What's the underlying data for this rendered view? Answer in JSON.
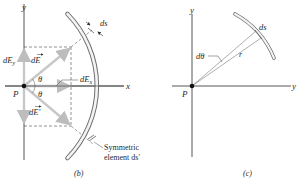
{
  "panel_b": {
    "caption": "(b)",
    "axis_y_label": "y",
    "axis_x_label": "x",
    "point_label": "P",
    "dE_label": "dE",
    "dE_prime_label": "dE'",
    "dEy_label": "dE",
    "dEy_sub": "y",
    "dEx_label": "dE",
    "dEx_sub": "x",
    "theta_upper": "θ",
    "theta_lower": "θ",
    "ds_label": "ds",
    "symmetric_line1": "Symmetric",
    "symmetric_line2": "element ds'"
  },
  "panel_c": {
    "caption": "(c)",
    "axis_y_label": "y",
    "axis_x_label": "y",
    "point_label": "P",
    "ds_label": "ds",
    "dtheta_label": "dθ",
    "r_label": "r"
  },
  "colors": {
    "axis": "#444444",
    "arc_fill": "#f4f4f4",
    "arc_stroke": "#6e6e6e",
    "vector": "#c8c8c8",
    "dashed": "#777777",
    "text": "#2a2a2a"
  }
}
